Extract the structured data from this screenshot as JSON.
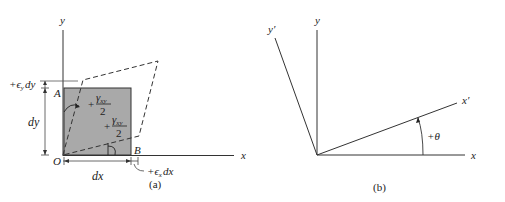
{
  "figure_a": {
    "caption": "(a)",
    "axis_x_label": "x",
    "axis_y_label": "y",
    "origin_label": "O",
    "corner_a_label": "A",
    "corner_b_label": "B",
    "dim_dx": "dx",
    "dim_dy": "dy",
    "strain_y_label": "+ϵ",
    "strain_y_sub": "y",
    "strain_y_suffix": "dy",
    "strain_x_label": "+ϵ",
    "strain_x_sub": "x",
    "strain_x_suffix": "dx",
    "shear_upper_sign": "+",
    "shear_upper_num": "γ",
    "shear_upper_sub": "xy",
    "shear_upper_den": "2",
    "shear_lower_sign": "+",
    "shear_lower_num": "γ",
    "shear_lower_sub": "xy",
    "shear_lower_den": "2",
    "element_fill": "#a9a9a9"
  },
  "figure_b": {
    "caption": "(b)",
    "axis_x_label": "x",
    "axis_y_label": "y",
    "axis_x_prime_label": "x′",
    "axis_y_prime_label": "y′",
    "angle_label": "+θ"
  }
}
